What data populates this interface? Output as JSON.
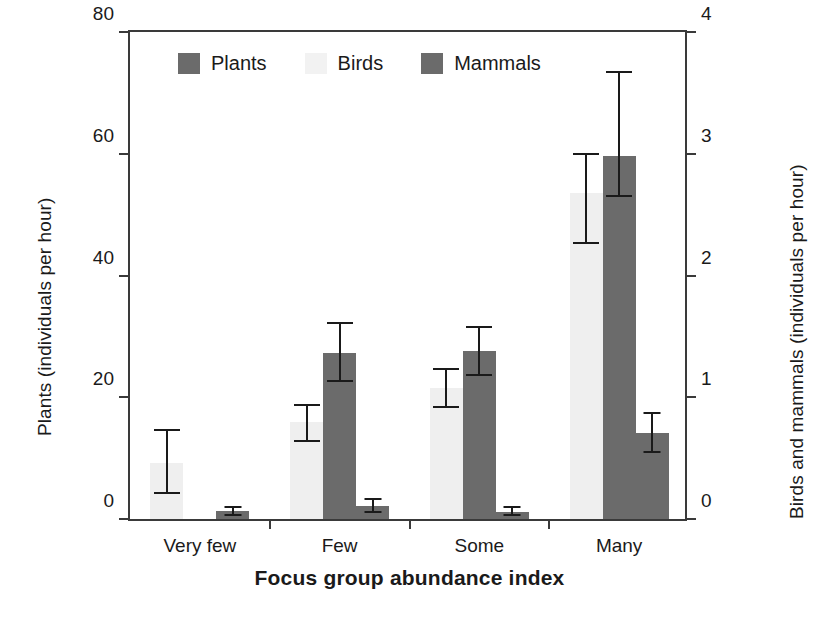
{
  "chart_data": {
    "type": "bar",
    "title": "",
    "xlabel": "Focus group abundance index",
    "ylabel": "Plants (individuals per hour)",
    "y2label": "Birds and mammals (individuals per hour)",
    "categories": [
      "Very few",
      "Few",
      "Some",
      "Many"
    ],
    "ylim": [
      0,
      80
    ],
    "y2lim": [
      0,
      4
    ],
    "yticks": [
      "0",
      "20",
      "40",
      "60",
      "80"
    ],
    "ytick_values": [
      0,
      20,
      40,
      60,
      80
    ],
    "y2ticks": [
      "0",
      "1",
      "2",
      "3",
      "4"
    ],
    "y2tick_values": [
      0,
      1,
      2,
      3,
      4
    ],
    "grid": false,
    "legend_position": "top-center",
    "series": [
      {
        "name": "Plants",
        "axis": "left",
        "color": "#6b6b6b",
        "values": [
          0,
          27.2,
          27.6,
          59.6
        ],
        "err_low": [
          0,
          22.6,
          23.7,
          53.0
        ],
        "err_high": [
          0,
          32.2,
          31.6,
          73.4
        ]
      },
      {
        "name": "Birds",
        "axis": "right",
        "color": "#efefef",
        "values": [
          0.46,
          0.8,
          1.08,
          2.68
        ],
        "err_low": [
          0.21,
          0.64,
          0.92,
          2.27
        ],
        "err_high": [
          0.73,
          0.94,
          1.23,
          3.0
        ]
      },
      {
        "name": "Mammals",
        "axis": "right",
        "color": "#6b6b6b",
        "values": [
          0.065,
          0.11,
          0.06,
          0.71
        ],
        "err_low": [
          0.03,
          0.06,
          0.03,
          0.55
        ],
        "err_high": [
          0.1,
          0.165,
          0.095,
          0.87
        ]
      }
    ]
  },
  "legend": {
    "items": [
      {
        "label": "Plants",
        "swatch": "plants"
      },
      {
        "label": "Birds",
        "swatch": "birds"
      },
      {
        "label": "Mammals",
        "swatch": "mammals"
      }
    ]
  },
  "axes": {
    "left_title": "Plants (individuals per hour)",
    "right_title": "Birds and mammals (individuals per hour)",
    "bottom_title": "Focus group abundance index"
  }
}
